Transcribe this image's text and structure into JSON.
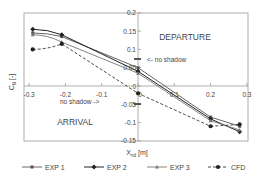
{
  "chart_data": {
    "type": "line",
    "title": "",
    "xlabel": "X",
    "xlabel_sub": "nd",
    "xlabel_unit": "[m]",
    "ylabel": "C",
    "ylabel_sub": "N",
    "ylabel_unit": "[-]",
    "xlim": [
      -0.3,
      0.3
    ],
    "ylim": [
      -0.15,
      0.2
    ],
    "x_ticks": [
      -0.3,
      -0.2,
      -0.1,
      0,
      0.1,
      0.2,
      0.3
    ],
    "x_tick_labels": [
      "-0.3",
      "-0.2",
      "-0.1",
      "0",
      "0.1",
      "0.2",
      "0.3"
    ],
    "y_ticks": [
      0.2,
      0.15,
      0.1,
      0.05,
      0,
      -0.05,
      -0.1,
      -0.15
    ],
    "y_tick_labels": [
      "0.2",
      "0.15",
      "0.1",
      "0.05",
      "0",
      "-0.05",
      "-0.1",
      "-0.15"
    ],
    "grid": false,
    "legend_position": "bottom",
    "annotations": [
      {
        "text": "DEPARTURE",
        "x": 0.17,
        "y": 0.13
      },
      {
        "text": "ARRIVAL",
        "x": -0.17,
        "y": -0.1
      },
      {
        "text": "<- no shadow",
        "x": 0.055,
        "y": 0.075
      },
      {
        "text": "no shadow ->",
        "x": -0.155,
        "y": -0.04
      }
    ],
    "series": [
      {
        "name": "EXP 1",
        "style": "solid",
        "marker": "small-square",
        "x": [
          -0.29,
          -0.21,
          0,
          0.2,
          0.28
        ],
        "values": [
          0.145,
          0.135,
          0.05,
          -0.085,
          -0.11
        ]
      },
      {
        "name": "EXP 2",
        "style": "solid",
        "marker": "diamond",
        "x": [
          -0.29,
          -0.21,
          0,
          0.2,
          0.28
        ],
        "values": [
          0.155,
          0.14,
          0.04,
          -0.09,
          -0.125
        ]
      },
      {
        "name": "EXP 3",
        "style": "solid",
        "marker": "small-triangle",
        "x": [
          -0.29,
          -0.21,
          0,
          0.2,
          0.28
        ],
        "values": [
          0.14,
          0.12,
          0.035,
          -0.095,
          -0.12
        ]
      },
      {
        "name": "CFD",
        "style": "dashed",
        "marker": "circle",
        "x": [
          -0.29,
          -0.21,
          0,
          0.2,
          0.28
        ],
        "values": [
          0.1,
          0.115,
          -0.02,
          -0.11,
          -0.105
        ]
      }
    ]
  },
  "legend": {
    "items": [
      "EXP 1",
      "EXP 2",
      "EXP 3",
      "CFD"
    ]
  },
  "labels": {
    "departure": "DEPARTURE",
    "arrival": "ARRIVAL",
    "no_shadow_right": "<- no shadow",
    "no_shadow_left": "no shadow ->",
    "xlabel": "X",
    "xlabel_sub": "nd",
    "xlabel_unit": " [m]",
    "ylabel": "C",
    "ylabel_sub": "N",
    "ylabel_unit": " [-]"
  }
}
